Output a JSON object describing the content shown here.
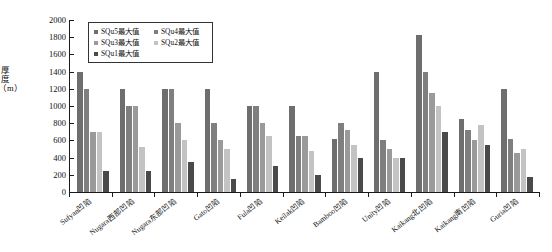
{
  "chart_data": {
    "type": "bar",
    "title": "",
    "xlabel": "",
    "ylabel": "厚度（m）",
    "ylim": [
      0,
      2000
    ],
    "yticks": [
      0,
      200,
      400,
      600,
      800,
      1000,
      1200,
      1400,
      1600,
      1800,
      2000
    ],
    "grid": false,
    "legend_position": "top-left",
    "categories": [
      "Sufyan凹陷",
      "Nugara西部凹陷",
      "Nugara东部凹陷",
      "Gato凹陷",
      "Fula凹陷",
      "Keilak凹陷",
      "Bamboo凹陷",
      "Unity凹陷",
      "Kaikang北凹陷",
      "Kaikang南凹陷",
      "Guria凹陷"
    ],
    "series": [
      {
        "name": "SQu5最大值",
        "color": "#6e6e6e",
        "values": [
          1400,
          1200,
          1200,
          1200,
          1000,
          1000,
          620,
          1400,
          1820,
          850,
          1200
        ]
      },
      {
        "name": "SQu4最大值",
        "color": "#7f7f7f",
        "values": [
          1200,
          1000,
          1200,
          800,
          1000,
          650,
          800,
          600,
          1400,
          720,
          620
        ]
      },
      {
        "name": "SQu3最大值",
        "color": "#9a9a9a",
        "values": [
          700,
          1000,
          800,
          600,
          800,
          650,
          720,
          500,
          1150,
          600,
          450
        ]
      },
      {
        "name": "SQu2最大值",
        "color": "#c3c3c3",
        "values": [
          700,
          520,
          600,
          500,
          650,
          480,
          550,
          400,
          1000,
          780,
          500
        ]
      },
      {
        "name": "SQu1最大值",
        "color": "#4a4a4a",
        "values": [
          250,
          250,
          350,
          150,
          300,
          200,
          400,
          400,
          700,
          550,
          180
        ]
      }
    ]
  }
}
